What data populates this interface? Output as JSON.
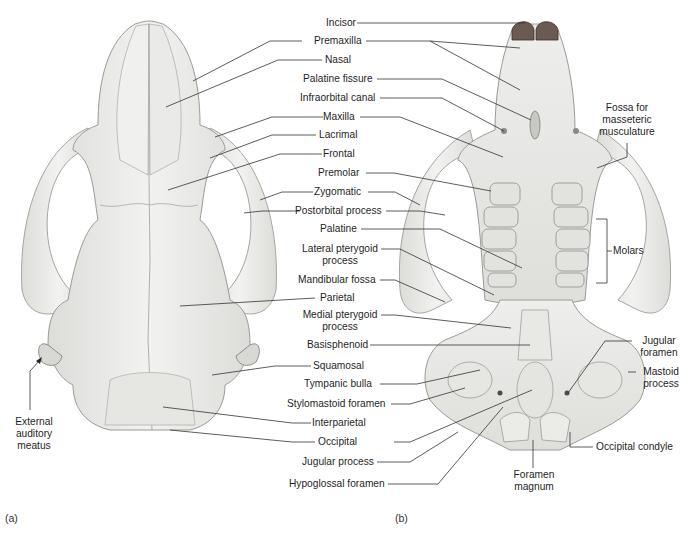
{
  "figure": {
    "panels": [
      {
        "id": "a",
        "tag": "(a)",
        "view": "dorsal skull"
      },
      {
        "id": "b",
        "tag": "(b)",
        "view": "ventral skull"
      }
    ],
    "center_labels": [
      {
        "text": "Incisor"
      },
      {
        "text": "Premaxilla"
      },
      {
        "text": "Nasal"
      },
      {
        "text": "Palatine fissure"
      },
      {
        "text": "Infraorbital canal"
      },
      {
        "text": "Maxilla"
      },
      {
        "text": "Lacrimal"
      },
      {
        "text": "Frontal"
      },
      {
        "text": "Premolar"
      },
      {
        "text": "Zygomatic"
      },
      {
        "text": "Postorbital process"
      },
      {
        "text": "Palatine"
      },
      {
        "text": "Lateral pterygoid",
        "line2": "process"
      },
      {
        "text": "Mandibular fossa"
      },
      {
        "text": "Parietal"
      },
      {
        "text": "Medial pterygoid",
        "line2": "process"
      },
      {
        "text": "Basisphenoid"
      },
      {
        "text": "Squamosal"
      },
      {
        "text": "Tympanic bulla"
      },
      {
        "text": "Stylomastoid foramen"
      },
      {
        "text": "Interparietal"
      },
      {
        "text": "Occipital"
      },
      {
        "text": "Jugular process"
      },
      {
        "text": "Hypoglossal foramen"
      }
    ],
    "side_labels": {
      "external_auditory_meatus": [
        "External",
        "auditory",
        "meatus"
      ],
      "fossa_masseteric": [
        "Fossa for",
        "masseteric",
        "musculature"
      ],
      "molars": "Molars",
      "jugular_foramen": [
        "Jugular",
        "foramen"
      ],
      "mastoid_process": [
        "Mastoid",
        "process"
      ],
      "occipital_condyle": "Occipital condyle",
      "foramen_magnum": [
        "Foramen",
        "magnum"
      ]
    },
    "colors": {
      "bone_fill": "#ececea",
      "bone_shade": "#d6d6d3",
      "bone_edge": "#9a9a96",
      "leader_line": "#333333",
      "incisor_dark": "#5a4a44"
    }
  }
}
